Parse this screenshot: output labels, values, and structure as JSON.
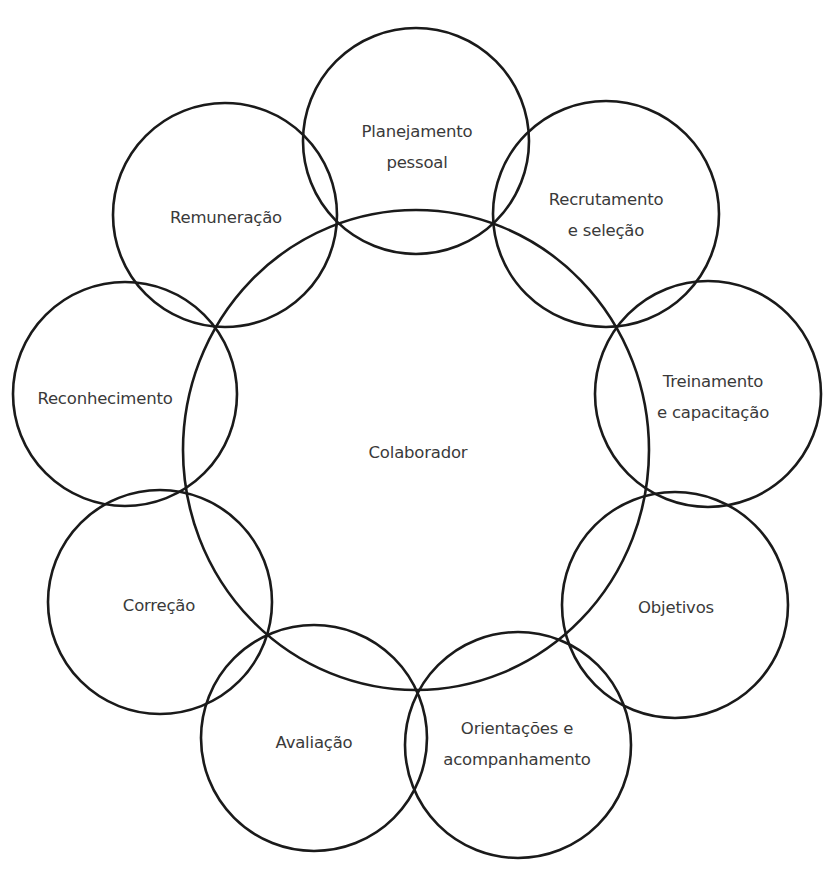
{
  "diagram": {
    "type": "circular-relationship-diagram",
    "center": {
      "label": "Colaborador",
      "cx": 416,
      "cy": 450,
      "rx": 233,
      "ry": 240,
      "text_x": 418,
      "text_y": 452
    },
    "nodes": [
      {
        "id": "planejamento",
        "lines": [
          "Planejamento",
          "pessoal"
        ],
        "cx": 416,
        "cy": 141,
        "r": 113,
        "text_x": 417,
        "text_y": 147
      },
      {
        "id": "recrutamento",
        "lines": [
          "Recrutamento",
          "e seleção"
        ],
        "cx": 606,
        "cy": 214,
        "r": 113,
        "text_x": 606,
        "text_y": 215
      },
      {
        "id": "treinamento",
        "lines": [
          "Treinamento",
          "e capacitação"
        ],
        "cx": 708,
        "cy": 394,
        "r": 113,
        "text_x": 713,
        "text_y": 397
      },
      {
        "id": "objetivos",
        "lines": [
          "Objetivos"
        ],
        "cx": 675,
        "cy": 605,
        "r": 113,
        "text_x": 676,
        "text_y": 607
      },
      {
        "id": "orientacoes",
        "lines": [
          "Orientações e",
          "acompanhamento"
        ],
        "cx": 518,
        "cy": 745,
        "r": 113,
        "text_x": 517,
        "text_y": 744
      },
      {
        "id": "avaliacao",
        "lines": [
          "Avaliação"
        ],
        "cx": 314,
        "cy": 738,
        "r": 113,
        "text_x": 314,
        "text_y": 742
      },
      {
        "id": "correcao",
        "lines": [
          "Correção"
        ],
        "cx": 160,
        "cy": 602,
        "r": 112,
        "text_x": 159,
        "text_y": 605
      },
      {
        "id": "reconhecimento",
        "lines": [
          "Reconhecimento"
        ],
        "cx": 125,
        "cy": 394,
        "r": 112,
        "text_x": 105,
        "text_y": 398
      },
      {
        "id": "remuneracao",
        "lines": [
          "Remuneração"
        ],
        "cx": 225,
        "cy": 215,
        "r": 112,
        "text_x": 226,
        "text_y": 217
      }
    ],
    "colors": {
      "stroke": "#1a1a1a",
      "text": "#3a3a3a",
      "background": "#ffffff"
    }
  }
}
